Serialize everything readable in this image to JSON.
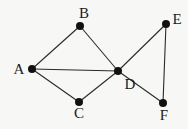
{
  "diagram": {
    "type": "graph",
    "nodes": [
      {
        "id": "A",
        "label": "A",
        "x": 32,
        "y": 69,
        "lx": 19,
        "ly": 74
      },
      {
        "id": "B",
        "label": "B",
        "x": 80,
        "y": 26,
        "lx": 84,
        "ly": 18
      },
      {
        "id": "C",
        "label": "C",
        "x": 79,
        "y": 102,
        "lx": 79,
        "ly": 118
      },
      {
        "id": "D",
        "label": "D",
        "x": 118,
        "y": 71,
        "lx": 130,
        "ly": 89
      },
      {
        "id": "E",
        "label": "E",
        "x": 166,
        "y": 24,
        "lx": 177,
        "ly": 24
      },
      {
        "id": "F",
        "label": "F",
        "x": 163,
        "y": 103,
        "lx": 164,
        "ly": 120
      }
    ],
    "edges": [
      [
        "A",
        "B"
      ],
      [
        "A",
        "C"
      ],
      [
        "A",
        "D"
      ],
      [
        "B",
        "D"
      ],
      [
        "C",
        "D"
      ],
      [
        "D",
        "E"
      ],
      [
        "D",
        "F"
      ],
      [
        "E",
        "F"
      ]
    ],
    "colors": {
      "node": "#111111",
      "edge": "#2a2a2a",
      "background": "#f7f7f5"
    }
  }
}
